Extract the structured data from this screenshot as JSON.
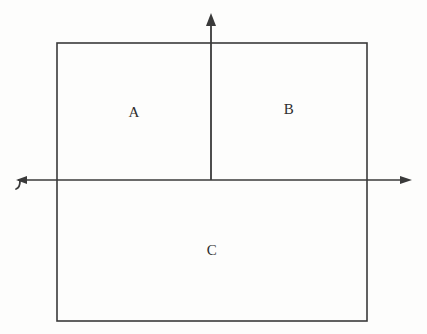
{
  "figure": {
    "kind": "geometry-diagram",
    "background_color": "#fdfdfc",
    "stroke_color": "#3a3a3a",
    "label_color": "#2e2e2e",
    "canvas": {
      "width": 427,
      "height": 334
    },
    "rectangle": {
      "name": "outer-rectangle",
      "left": 57,
      "top": 43,
      "right": 367,
      "bottom": 321,
      "stroke_width": 1.6
    },
    "x_axis": {
      "name": "horizontal-axis",
      "y": 180,
      "start_x": 18,
      "end_x": 412,
      "stroke_width": 1.3,
      "left_marker": "bent-arrow-left",
      "right_marker": "arrowhead-right"
    },
    "y_axis": {
      "name": "vertical-axis",
      "x": 211,
      "start_y": 180,
      "end_y": 14,
      "stroke_width": 1.8,
      "top_marker": "arrowhead-up"
    },
    "regions": [
      {
        "id": "A",
        "label": "A",
        "cx": 134,
        "cy": 112
      },
      {
        "id": "B",
        "label": "B",
        "cx": 289,
        "cy": 109
      },
      {
        "id": "C",
        "label": "C",
        "cx": 212,
        "cy": 250
      }
    ]
  }
}
